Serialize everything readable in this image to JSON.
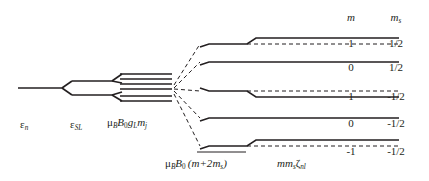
{
  "figure": {
    "type": "energy-level-splitting-diagram",
    "width": 429,
    "height": 181,
    "background": "#ffffff",
    "line_color": "#231f20",
    "text_color": "#231f20"
  },
  "stage_labels": {
    "level_0": {
      "symbol": "ε",
      "sub": "n",
      "text": "εn"
    },
    "level_1": {
      "symbol": "ε",
      "sub": "SL",
      "text": "εSL"
    },
    "level_2": {
      "text": "μB B0 gL mj"
    },
    "level_3": {
      "text": "μB B0 (m+2ms)"
    },
    "level_4": {
      "text": "mms ζnl"
    }
  },
  "columns": {
    "m_header": "m",
    "ms_header": "m",
    "ms_header_sub": "s"
  },
  "levels": [
    {
      "m": "1",
      "ms": "1/2",
      "shift": "up",
      "y": 44,
      "dashed": true
    },
    {
      "m": "0",
      "ms": "1/2",
      "shift": "none",
      "y": 62,
      "dashed": false
    },
    {
      "m": "1",
      "ms": "-1/2",
      "shift": "down",
      "y": 91,
      "dashed": true
    },
    {
      "m": "0",
      "ms": "-1/2",
      "shift": "none",
      "y": 118,
      "dashed": false
    },
    {
      "m": "-1",
      "ms": "-1/2",
      "shift": "up",
      "y": 146,
      "dashed": true
    }
  ],
  "multiplet": {
    "line_count": 6,
    "description": "closely spaced mj sublevels"
  }
}
